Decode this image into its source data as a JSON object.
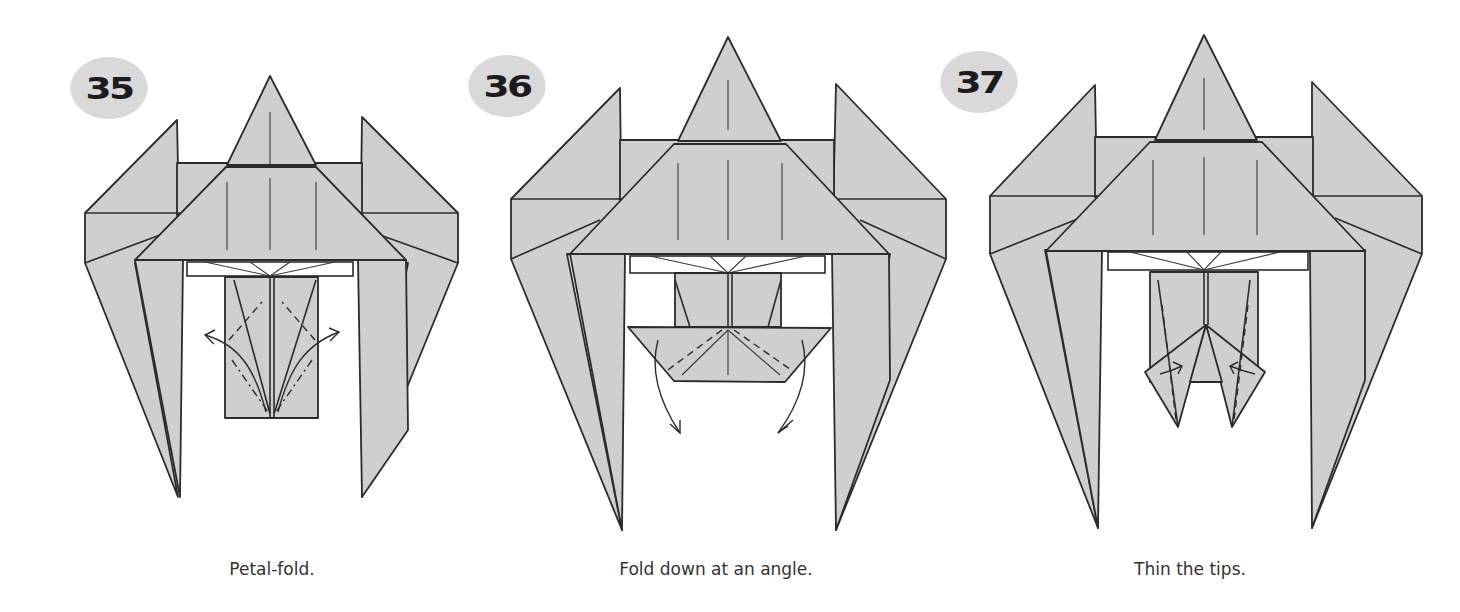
{
  "page": {
    "background": "#ffffff",
    "paper_color": "#cfcfcf",
    "line_color": "#2b2b2b",
    "badge_color": "#d9d9d9"
  },
  "steps": [
    {
      "number": "35",
      "caption": "Petal-fold.",
      "icon": "petal-fold-diagram"
    },
    {
      "number": "36",
      "caption": "Fold down at an angle.",
      "icon": "fold-down-angle-diagram"
    },
    {
      "number": "37",
      "caption": "Thin the tips.",
      "icon": "thin-tips-diagram"
    }
  ]
}
